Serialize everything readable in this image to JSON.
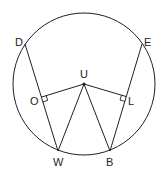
{
  "diagram": {
    "type": "circle-geometry",
    "colors": {
      "stroke": "#231f20",
      "background": "#ffffff"
    },
    "circle": {
      "cx": 84,
      "cy": 84,
      "r": 71
    },
    "points": {
      "D": {
        "label": "D",
        "x": 25,
        "y": 44
      },
      "E": {
        "label": "E",
        "x": 142,
        "y": 44
      },
      "U": {
        "label": "U",
        "x": 84,
        "y": 84
      },
      "O": {
        "label": "O",
        "x": 41.4,
        "y": 97.1
      },
      "L": {
        "label": "L",
        "x": 126.3,
        "y": 96.6
      },
      "W": {
        "label": "W",
        "x": 58,
        "y": 151
      },
      "B": {
        "label": "B",
        "x": 110,
        "y": 151
      }
    },
    "segments": [
      "DW",
      "EB",
      "UO",
      "UL",
      "UW",
      "UB"
    ],
    "right_angles": [
      "O",
      "L"
    ],
    "center_point": "U"
  }
}
